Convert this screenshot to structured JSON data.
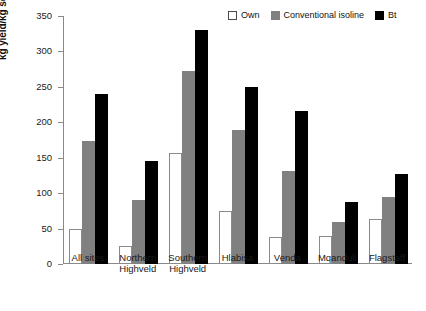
{
  "chart_data": {
    "type": "bar",
    "title": "",
    "xlabel": "",
    "ylabel": "kg yield/kg seed planted",
    "ylim": [
      0,
      350
    ],
    "yticks": [
      0,
      50,
      100,
      150,
      200,
      250,
      300,
      350
    ],
    "grid": false,
    "legend_position": "top-right",
    "categories": [
      "All sites",
      "Northern Highveld",
      "Southern Highveld",
      "Hlabisa",
      "Venda",
      "Mqanduli",
      "Flagstaff"
    ],
    "category_lines": [
      [
        "All sites"
      ],
      [
        "Northern",
        "Highveld"
      ],
      [
        "Southern",
        "Highveld"
      ],
      [
        "Hlabisa"
      ],
      [
        "Venda"
      ],
      [
        "Mqanduli"
      ],
      [
        "Flagstaff"
      ]
    ],
    "series": [
      {
        "name": "Own",
        "color": "#ffffff",
        "values": [
          49,
          26,
          157,
          75,
          38,
          40,
          63
        ]
      },
      {
        "name": "Conventional isoline",
        "color": "#808080",
        "values": [
          173,
          90,
          273,
          189,
          131,
          60,
          95
        ]
      },
      {
        "name": "Bt",
        "color": "#000000",
        "values": [
          240,
          145,
          330,
          250,
          216,
          88,
          127
        ]
      }
    ]
  },
  "legend": {
    "items": [
      {
        "label": "Own",
        "swatch": "white-square-icon"
      },
      {
        "label": "Conventional isoline",
        "swatch": "gray-square-icon"
      },
      {
        "label": "Bt",
        "swatch": "black-square-icon"
      }
    ]
  },
  "axis": {
    "y_title": "kg yield/kg seed planted",
    "y_tick_labels": [
      "0",
      "50",
      "100",
      "150",
      "200",
      "250",
      "300",
      "350"
    ]
  }
}
